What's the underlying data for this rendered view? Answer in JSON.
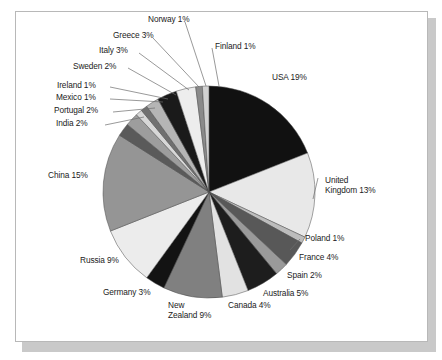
{
  "figure": {
    "kind": "pie-chart",
    "background_color": "#ffffff",
    "frame_border_color": "#b8b8b8",
    "shadow_color": "#c9c9c9"
  },
  "chart_data": {
    "type": "pie",
    "title": "",
    "subtitle": "",
    "xlabel": "",
    "ylabel": "",
    "grid": false,
    "legend_position": "none",
    "label_format": "{name} {value}%",
    "start_angle_deg": 0,
    "direction": "clockwise",
    "total_percent": 100,
    "categories": [
      "USA",
      "United Kingdom",
      "Poland",
      "France",
      "Spain",
      "Australia",
      "Canada",
      "New Zealand",
      "Germany",
      "Russia",
      "China",
      "India",
      "Portugal",
      "Mexico",
      "Ireland",
      "Sweden",
      "Italy",
      "Greece",
      "Norway",
      "Finland"
    ],
    "values": [
      19,
      13,
      1,
      4,
      2,
      5,
      4,
      9,
      3,
      9,
      15,
      2,
      2,
      1,
      1,
      2,
      3,
      3,
      1,
      1
    ],
    "colors": [
      "#111111",
      "#e8e8e8",
      "#bdbdbd",
      "#585858",
      "#9a9a9a",
      "#1d1d1d",
      "#e2e2e2",
      "#808080",
      "#131313",
      "#ececec",
      "#959595",
      "#5a5a5a",
      "#9d9d9d",
      "#d7d7d7",
      "#707070",
      "#b5b5b5",
      "#1a1a1a",
      "#ededed",
      "#8a8a8a",
      "#d2d2d2"
    ],
    "slices": [
      {
        "name": "USA",
        "value": 19,
        "label": "USA 19%",
        "color": "#111111"
      },
      {
        "name": "United Kingdom",
        "value": 13,
        "label": "United Kingdom 13%",
        "color": "#e8e8e8"
      },
      {
        "name": "Poland",
        "value": 1,
        "label": "Poland 1%",
        "color": "#bdbdbd"
      },
      {
        "name": "France",
        "value": 4,
        "label": "France 4%",
        "color": "#585858"
      },
      {
        "name": "Spain",
        "value": 2,
        "label": "Spain 2%",
        "color": "#9a9a9a"
      },
      {
        "name": "Australia",
        "value": 5,
        "label": "Australia 5%",
        "color": "#1d1d1d"
      },
      {
        "name": "Canada",
        "value": 4,
        "label": "Canada 4%",
        "color": "#e2e2e2"
      },
      {
        "name": "New Zealand",
        "value": 9,
        "label": "New Zealand 9%",
        "color": "#808080"
      },
      {
        "name": "Germany",
        "value": 3,
        "label": "Germany 3%",
        "color": "#131313"
      },
      {
        "name": "Russia",
        "value": 9,
        "label": "Russia 9%",
        "color": "#ececec"
      },
      {
        "name": "China",
        "value": 15,
        "label": "China 15%",
        "color": "#959595"
      },
      {
        "name": "India",
        "value": 2,
        "label": "India 2%",
        "color": "#5a5a5a"
      },
      {
        "name": "Portugal",
        "value": 2,
        "label": "Portugal 2%",
        "color": "#9d9d9d"
      },
      {
        "name": "Mexico",
        "value": 1,
        "label": "Mexico 1%",
        "color": "#d7d7d7"
      },
      {
        "name": "Ireland",
        "value": 1,
        "label": "Ireland 1%",
        "color": "#707070"
      },
      {
        "name": "Sweden",
        "value": 2,
        "label": "Sweden 2%",
        "color": "#b5b5b5"
      },
      {
        "name": "Italy",
        "value": 3,
        "label": "Italy 3%",
        "color": "#1a1a1a"
      },
      {
        "name": "Greece",
        "value": 3,
        "label": "Greece 3%",
        "color": "#ededed"
      },
      {
        "name": "Norway",
        "value": 1,
        "label": "Norway 1%",
        "color": "#8a8a8a"
      },
      {
        "name": "Finland",
        "value": 1,
        "label": "Finland 1%",
        "color": "#d2d2d2"
      }
    ]
  },
  "labels": {
    "usa": "USA 19%",
    "united_kingdom_line1": "United",
    "united_kingdom_line2": "Kingdom 13%",
    "poland": "Poland 1%",
    "france": "France 4%",
    "spain": "Spain 2%",
    "australia": "Australia 5%",
    "canada": "Canada 4%",
    "new_zealand_line1": "New",
    "new_zealand_line2": "Zealand 9%",
    "germany": "Germany 3%",
    "russia": "Russia 9%",
    "china": "China 15%",
    "india": "India 2%",
    "portugal": "Portugal 2%",
    "mexico": "Mexico 1%",
    "ireland": "Ireland 1%",
    "sweden": "Sweden 2%",
    "italy": "Italy 3%",
    "greece": "Greece 3%",
    "norway": "Norway 1%",
    "finland": "Finland 1%"
  }
}
